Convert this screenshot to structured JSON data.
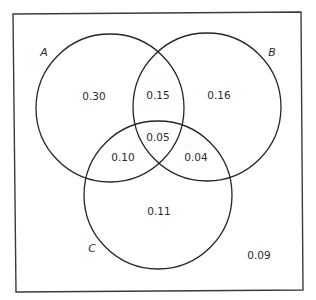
{
  "diagram": {
    "type": "venn-3-set",
    "sets": [
      {
        "name": "A",
        "label": "A"
      },
      {
        "name": "B",
        "label": "B"
      },
      {
        "name": "C",
        "label": "C"
      }
    ],
    "regions": {
      "a_only": "0.30",
      "ab_only": "0.15",
      "b_only": "0.16",
      "abc": "0.05",
      "ac_only": "0.10",
      "bc_only": "0.04",
      "c_only": "0.11",
      "outside": "0.09"
    },
    "colors": {
      "stroke": "#262626",
      "frame": "#3a3a3a",
      "text": "#2a2a2a",
      "background": "#ffffff"
    }
  }
}
